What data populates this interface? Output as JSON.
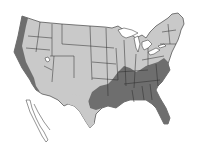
{
  "map": {
    "type": "choropleth",
    "region": "United States (contiguous)",
    "legend": null,
    "colors": {
      "background": "#ffffff",
      "land_light": "#c9c9c9",
      "zone_dark": "#6e6e6e",
      "zone_mid": "#8a8a8a",
      "water": "#ffffff",
      "border": "#2a2a2a"
    },
    "shaded_zones": [
      {
        "name": "west-coast-band",
        "shade": "dark"
      },
      {
        "name": "southeast-region",
        "shade": "dark"
      },
      {
        "name": "east-coast-mid-atlantic-strip",
        "shade": "dark"
      }
    ]
  }
}
